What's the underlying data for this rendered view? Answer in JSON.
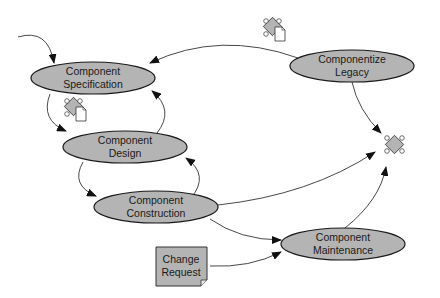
{
  "diagram": {
    "nodes": {
      "spec": {
        "line1": "Component",
        "line2": "Specification"
      },
      "design": {
        "line1": "Component",
        "line2": "Design"
      },
      "construction": {
        "line1": "Component",
        "line2": "Construction"
      },
      "legacy": {
        "line1": "Componentize",
        "line2": "Legacy"
      },
      "maintenance": {
        "line1": "Component",
        "line2": "Maintenance"
      },
      "change_request": {
        "line1": "Change",
        "line2": "Request"
      }
    },
    "icons": [
      "component-document-icon",
      "component-document-icon",
      "component-icon"
    ],
    "colors": {
      "node_fill": "#b4b4b4",
      "node_stroke": "#1a1a1a",
      "edge": "#333333",
      "background": "#ffffff"
    }
  }
}
